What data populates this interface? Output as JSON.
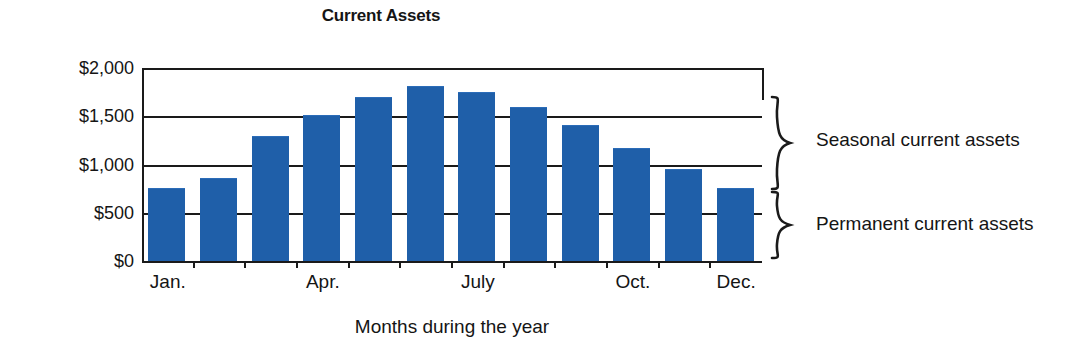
{
  "chart_data": {
    "type": "bar",
    "title": "Current Assets",
    "xlabel": "Months during the year",
    "ylabel": "",
    "categories": [
      "Jan.",
      "Feb.",
      "Mar.",
      "Apr.",
      "May",
      "June",
      "July",
      "Aug.",
      "Sept.",
      "Oct.",
      "Nov.",
      "Dec."
    ],
    "values": [
      750,
      850,
      1290,
      1500,
      1690,
      1800,
      1740,
      1590,
      1400,
      1160,
      940,
      750
    ],
    "ylim": [
      0,
      2000
    ],
    "ytick_values": [
      0,
      500,
      1000,
      1500,
      2000
    ],
    "ytick_labels": [
      "$0",
      "$500",
      "$1,000",
      "$1,500",
      "$2,000"
    ],
    "xtick_labels": [
      "Jan.",
      "Apr.",
      "July",
      "Oct.",
      "Dec."
    ],
    "xtick_categories": [
      0,
      3,
      6,
      9,
      11
    ],
    "grid": "horizontal",
    "legend": "none",
    "bar_color": "#1f5fa9",
    "annotations": [
      {
        "label": "Seasonal current assets",
        "from": 750,
        "to": 2000
      },
      {
        "label": "Permanent current assets",
        "from": 0,
        "to": 750
      }
    ]
  },
  "chart": {
    "title": "Current Assets",
    "axis_caption": "Months during the year",
    "y_ticks": [
      {
        "label": "$2,000",
        "value": 2000
      },
      {
        "label": "$1,500",
        "value": 1500
      },
      {
        "label": "$1,000",
        "value": 1000
      },
      {
        "label": "$500",
        "value": 500
      },
      {
        "label": "$0",
        "value": 0
      }
    ],
    "x_ticks": [
      {
        "label": "Jan."
      },
      {
        "label": "Apr."
      },
      {
        "label": "July"
      },
      {
        "label": "Oct."
      },
      {
        "label": "Dec."
      }
    ],
    "annotations": {
      "seasonal": "Seasonal current assets",
      "permanent": "Permanent current assets"
    }
  }
}
